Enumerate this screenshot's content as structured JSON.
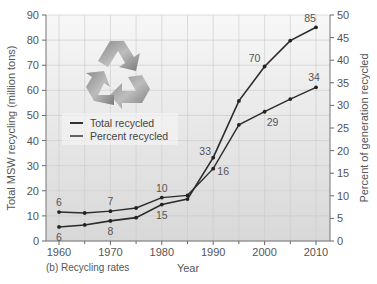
{
  "chart_data": {
    "type": "line",
    "title": "",
    "caption": "(b) Recycling rates",
    "xlabel": "Year",
    "ylabel": "Total MSW recycling (million tons)",
    "ylabel_right": "Percent of generation recycled",
    "x": [
      1960,
      1965,
      1970,
      1975,
      1980,
      1985,
      1990,
      1995,
      2000,
      2005,
      2010
    ],
    "xlim": [
      1958,
      2013
    ],
    "ylim": [
      0,
      90
    ],
    "ylim_right": [
      0,
      50
    ],
    "xticks": [
      "1960",
      "1970",
      "1980",
      "1990",
      "2000",
      "2010"
    ],
    "yticks": [
      "0",
      "10",
      "20",
      "30",
      "40",
      "50",
      "60",
      "70",
      "80",
      "90"
    ],
    "yticks_right": [
      "0",
      "5",
      "10",
      "15",
      "20",
      "25",
      "30",
      "35",
      "40",
      "45",
      "50"
    ],
    "grid": true,
    "legend_position": "upper left",
    "series": [
      {
        "name": "Total recycled",
        "axis": "left",
        "values": [
          5.6,
          6.4,
          8.0,
          9.3,
          14.5,
          16.7,
          33.2,
          55.8,
          69.5,
          79.8,
          85.1
        ]
      },
      {
        "name": "Percent recycled",
        "axis": "right",
        "values": [
          6.4,
          6.2,
          6.6,
          7.3,
          9.6,
          10.1,
          16.0,
          25.7,
          28.6,
          31.4,
          34.0
        ]
      }
    ],
    "annotations": [
      {
        "text": "6",
        "x": 1960,
        "series": "Percent recycled"
      },
      {
        "text": "6",
        "x": 1960,
        "series": "Total recycled"
      },
      {
        "text": "7",
        "x": 1970,
        "series": "Percent recycled"
      },
      {
        "text": "8",
        "x": 1970,
        "series": "Total recycled"
      },
      {
        "text": "10",
        "x": 1980,
        "series": "Percent recycled"
      },
      {
        "text": "15",
        "x": 1980,
        "series": "Total recycled"
      },
      {
        "text": "33",
        "x": 1990,
        "series": "Total recycled"
      },
      {
        "text": "16",
        "x": 1990,
        "series": "Percent recycled"
      },
      {
        "text": "70",
        "x": 2000,
        "series": "Total recycled"
      },
      {
        "text": "29",
        "x": 2000,
        "series": "Percent recycled"
      },
      {
        "text": "85",
        "x": 2010,
        "series": "Total recycled"
      },
      {
        "text": "34",
        "x": 2010,
        "series": "Percent recycled"
      }
    ]
  },
  "legend": {
    "total": "Total recycled",
    "percent": "Percent recycled"
  },
  "icon": "recycle-icon"
}
